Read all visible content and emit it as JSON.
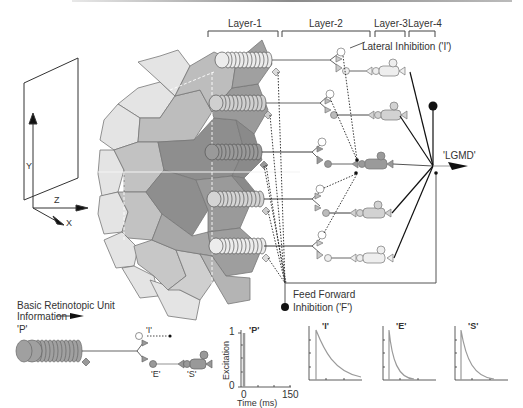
{
  "layers": [
    "Layer-1",
    "Layer-2",
    "Layer-3",
    "Layer-4"
  ],
  "annotations": {
    "lateral_inhibition": "Lateral Inhibition ('I')",
    "lgmd": "'LGMD'",
    "feed_forward_1": "Feed Forward",
    "feed_forward_2": "Inhibition ('F')"
  },
  "axes_diagram": {
    "y": "Y",
    "z": "Z",
    "x": "X"
  },
  "unit": {
    "title": "Basic Retinotopic Unit",
    "information": "Information",
    "p": "'P'",
    "i": "'I'",
    "e": "'E'",
    "s": "'S'"
  },
  "plots": {
    "ylabel": "Excitation",
    "xlabel": "Time (ms)",
    "y_min": "0",
    "y_max": "1",
    "x_min": "0",
    "x_max": "150",
    "titles": [
      "'P'",
      "'I'",
      "'E'",
      "'S'"
    ]
  },
  "colors": {
    "light": "#e2e2e2",
    "mid": "#b9b9b9",
    "dark": "#8f8f8f",
    "line": "#333333",
    "curve": "#9a9a9a"
  }
}
